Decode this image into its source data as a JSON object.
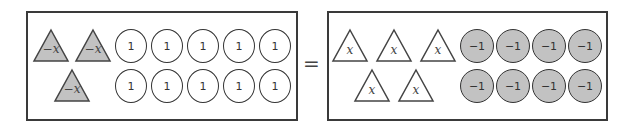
{
  "colors": {
    "border": "#3a3a3a",
    "negative_fill": "#c2c2c2",
    "positive_fill": "#ffffff"
  },
  "left_side": {
    "triangles": [
      {
        "label": "−x",
        "fill": "#c2c2c2"
      },
      {
        "label": "−x",
        "fill": "#c2c2c2"
      },
      {
        "label": "−x",
        "fill": "#c2c2c2"
      }
    ],
    "circles": [
      {
        "label": "1"
      },
      {
        "label": "1"
      },
      {
        "label": "1"
      },
      {
        "label": "1"
      },
      {
        "label": "1"
      },
      {
        "label": "1"
      },
      {
        "label": "1"
      },
      {
        "label": "1"
      },
      {
        "label": "1"
      },
      {
        "label": "1"
      }
    ]
  },
  "equals_sign": "=",
  "right_side": {
    "triangles": [
      {
        "label": "x",
        "fill": "#ffffff"
      },
      {
        "label": "x",
        "fill": "#ffffff"
      },
      {
        "label": "x",
        "fill": "#ffffff"
      },
      {
        "label": "x",
        "fill": "#ffffff"
      },
      {
        "label": "x",
        "fill": "#ffffff"
      }
    ],
    "circles": [
      {
        "label": "−1"
      },
      {
        "label": "−1"
      },
      {
        "label": "−1"
      },
      {
        "label": "−1"
      },
      {
        "label": "−1"
      },
      {
        "label": "−1"
      },
      {
        "label": "−1"
      },
      {
        "label": "−1"
      }
    ]
  }
}
